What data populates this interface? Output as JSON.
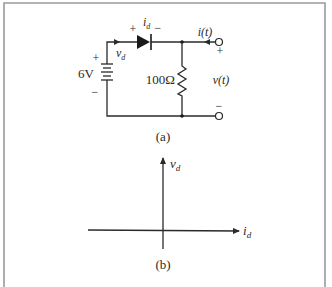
{
  "figure": {
    "part_a": {
      "caption": "(a)",
      "source": {
        "label": "6V",
        "plus": "+",
        "minus": "−"
      },
      "diode": {
        "current_label": "i",
        "current_sub": "d",
        "plus": "+",
        "minus": "−"
      },
      "diode_voltage": {
        "label": "v",
        "sub": "d"
      },
      "resistor": {
        "label": "100Ω"
      },
      "output": {
        "current_label": "i(t)",
        "voltage_label": "v(t)",
        "plus": "+",
        "minus": "−"
      }
    },
    "part_b": {
      "caption": "(b)",
      "y_axis": {
        "label": "v",
        "sub": "d"
      },
      "x_axis": {
        "label": "i",
        "sub": "d"
      }
    }
  }
}
